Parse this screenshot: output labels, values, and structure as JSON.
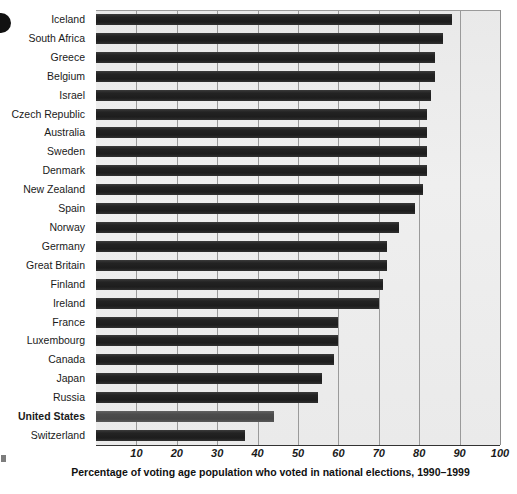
{
  "chart_data": {
    "type": "bar",
    "orientation": "horizontal",
    "title": "",
    "xlabel": "Percentage of voting age population who voted in national elections, 1990–1999",
    "ylabel": "",
    "xlim": [
      0,
      100
    ],
    "xticks": [
      10,
      20,
      30,
      40,
      50,
      60,
      70,
      80,
      90,
      100
    ],
    "grid": true,
    "legend": "none",
    "highlight_category": "United States",
    "categories": [
      "Iceland",
      "South Africa",
      "Greece",
      "Belgium",
      "Israel",
      "Czech Republic",
      "Australia",
      "Sweden",
      "Denmark",
      "New Zealand",
      "Spain",
      "Norway",
      "Germany",
      "Great Britain",
      "Finland",
      "Ireland",
      "France",
      "Luxembourg",
      "Canada",
      "Japan",
      "Russia",
      "United States",
      "Switzerland"
    ],
    "values": [
      88,
      86,
      84,
      84,
      83,
      82,
      82,
      82,
      82,
      81,
      79,
      75,
      72,
      72,
      71,
      70,
      60,
      60,
      59,
      56,
      55,
      44,
      37
    ]
  },
  "axis": {
    "tick_labels": [
      "10",
      "20",
      "30",
      "40",
      "50",
      "60",
      "70",
      "80",
      "90",
      "100"
    ]
  },
  "caption": {
    "text": "Percentage of voting age population who voted in national elections, 1990–1999"
  },
  "colors": {
    "bar": "#232323",
    "bar_highlight": "#4c4c4c",
    "plot_background": "#ebebeb",
    "gridline": "#9a9a9a",
    "axis": "#333333",
    "text": "#1a1a1a"
  }
}
